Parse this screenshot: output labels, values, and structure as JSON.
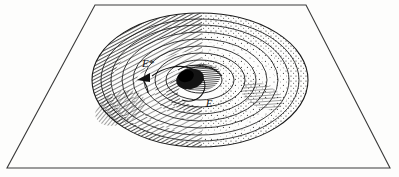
{
  "figure": {
    "background_color": "#fdfdfc",
    "ink_color": "#111111",
    "frame": {
      "name": "plane-trapezoid",
      "points": "95,5 306,5 390,168 7,168",
      "stroke": "#3a3a3a",
      "stroke_width": 1.1
    },
    "funnel": {
      "center_x": 200,
      "center_y": 80,
      "outer_rx": 108,
      "outer_ry": 67,
      "throat_rx": 22,
      "throat_ry": 13,
      "ring_count": 9,
      "hatch_side": "left",
      "stipple_side": "right",
      "throat_color": "#1a1a1a"
    },
    "labels": [
      {
        "id": "label-e-star",
        "text": "E*",
        "x": 150,
        "y": 64,
        "note": "upper-left point on the funnel wall, arrow beneath"
      },
      {
        "id": "label-e",
        "text": "E",
        "x": 207,
        "y": 104,
        "note": "lower point near the throat rim"
      }
    ],
    "arrow": {
      "name": "trajectory-arrow",
      "description": "short dark arrowhead beneath E* pointing down-left along the spiral path",
      "tip_x": 139,
      "tip_y": 78
    },
    "trajectory": {
      "name": "infall-path",
      "description": "curved line running from near E* across the throat rim down to E"
    }
  }
}
